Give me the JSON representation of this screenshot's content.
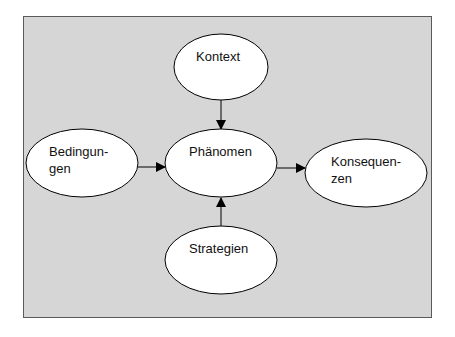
{
  "diagram": {
    "background_color": "#d6d6d6",
    "border_color": "#5a5a5a",
    "node_fill": "#ffffff",
    "node_stroke": "#000000",
    "nodes": [
      {
        "id": "kontext",
        "label": "Kontext",
        "cx": 221,
        "cy": 67,
        "rx": 47,
        "ry": 33
      },
      {
        "id": "bedingungen",
        "label": "Bedingun-\ngen",
        "cx": 82,
        "cy": 163,
        "rx": 56,
        "ry": 34
      },
      {
        "id": "phaenomen",
        "label": "Phänomen",
        "cx": 221,
        "cy": 163,
        "rx": 56,
        "ry": 34
      },
      {
        "id": "konsequenzen",
        "label": "Konsequen-\nzen",
        "cx": 366,
        "cy": 173,
        "rx": 61,
        "ry": 34
      },
      {
        "id": "strategien",
        "label": "Strategien",
        "cx": 221,
        "cy": 260,
        "rx": 56,
        "ry": 34
      }
    ],
    "edges": [
      {
        "from": "kontext",
        "to": "phaenomen"
      },
      {
        "from": "bedingungen",
        "to": "phaenomen"
      },
      {
        "from": "phaenomen",
        "to": "konsequenzen"
      },
      {
        "from": "strategien",
        "to": "phaenomen"
      }
    ]
  }
}
